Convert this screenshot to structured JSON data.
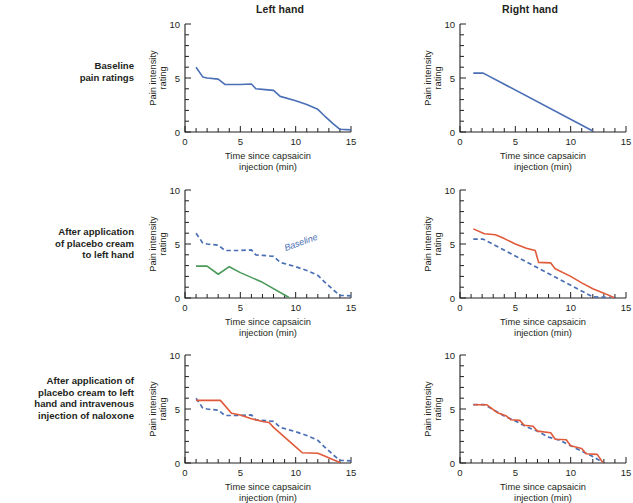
{
  "figure": {
    "columns": [
      {
        "id": "left-hand",
        "label": "Left hand"
      },
      {
        "id": "right-hand",
        "label": "Right hand"
      }
    ],
    "rows": [
      {
        "id": "baseline",
        "label": "Baseline\npain ratings"
      },
      {
        "id": "placebo",
        "label": "After application\nof placebo cream\nto left hand"
      },
      {
        "id": "naloxone",
        "label": "After application of\nplacebo cream to left\nhand and intravenous\ninjection of naloxone"
      }
    ]
  },
  "colors": {
    "baseline_blue": "#4a6fb5",
    "placebo_green": "#4a9a5a",
    "naloxone_orange": "#e05a3a",
    "axis": "#231f20"
  },
  "axes": {
    "xlabel_line1": "Time since capsaicin",
    "xlabel_line2": "injection (min)",
    "ylabel_line1": "Pain intensity",
    "ylabel_line2": "rating",
    "xlim": [
      0,
      15
    ],
    "ylim": [
      0,
      10
    ],
    "xticks_major": [
      0,
      5,
      10,
      15
    ],
    "xticks_minor_step": 1,
    "yticks_major": [
      0,
      5,
      10
    ],
    "yticks_minor_step": 1,
    "grid": false
  },
  "annotations": {
    "baseline_label": "Baseline"
  },
  "chart_data": [
    {
      "id": "r0c0",
      "type": "line",
      "title": "Left hand — Baseline pain ratings",
      "xlabel": "Time since capsaicin injection (min)",
      "ylabel": "Pain intensity rating",
      "xlim": [
        0,
        15
      ],
      "ylim": [
        0,
        10
      ],
      "series": [
        {
          "name": "Baseline (left hand)",
          "color": "#4a6fb5",
          "style": "solid",
          "points": [
            [
              1,
              6.0
            ],
            [
              1.6,
              5.1
            ],
            [
              2,
              5.0
            ],
            [
              3,
              4.9
            ],
            [
              3.6,
              4.4
            ],
            [
              5,
              4.4
            ],
            [
              6,
              4.45
            ],
            [
              6.4,
              4.0
            ],
            [
              7,
              3.95
            ],
            [
              8,
              3.85
            ],
            [
              8.6,
              3.3
            ],
            [
              10,
              2.9
            ],
            [
              11,
              2.55
            ],
            [
              12,
              2.1
            ],
            [
              12.6,
              1.5
            ],
            [
              13.4,
              0.75
            ],
            [
              14,
              0.25
            ],
            [
              15,
              0.2
            ]
          ]
        }
      ]
    },
    {
      "id": "r0c1",
      "type": "line",
      "title": "Right hand — Baseline pain ratings",
      "xlabel": "Time since capsaicin injection (min)",
      "ylabel": "Pain intensity rating",
      "xlim": [
        0,
        15
      ],
      "ylim": [
        0,
        10
      ],
      "series": [
        {
          "name": "Baseline (right hand)",
          "color": "#4a6fb5",
          "style": "solid",
          "points": [
            [
              1.2,
              5.45
            ],
            [
              2.1,
              5.45
            ],
            [
              12,
              0.1
            ]
          ]
        }
      ]
    },
    {
      "id": "r1c0",
      "type": "line",
      "title": "Left hand — After application of placebo cream to left hand",
      "xlabel": "Time since capsaicin injection (min)",
      "ylabel": "Pain intensity rating",
      "xlim": [
        0,
        15
      ],
      "ylim": [
        0,
        10
      ],
      "series": [
        {
          "name": "Baseline",
          "color": "#4a6fb5",
          "style": "dashed",
          "points": [
            [
              1,
              6.0
            ],
            [
              1.6,
              5.1
            ],
            [
              2,
              5.0
            ],
            [
              3,
              4.9
            ],
            [
              3.6,
              4.4
            ],
            [
              5,
              4.4
            ],
            [
              6,
              4.45
            ],
            [
              6.4,
              4.0
            ],
            [
              7,
              3.95
            ],
            [
              8,
              3.85
            ],
            [
              8.6,
              3.3
            ],
            [
              10,
              2.9
            ],
            [
              11,
              2.55
            ],
            [
              12,
              2.1
            ],
            [
              12.6,
              1.5
            ],
            [
              13.4,
              0.75
            ],
            [
              14,
              0.25
            ],
            [
              15,
              0.2
            ]
          ]
        },
        {
          "name": "Placebo cream",
          "color": "#4a9a5a",
          "style": "solid",
          "points": [
            [
              1,
              2.95
            ],
            [
              2,
              2.95
            ],
            [
              3,
              2.2
            ],
            [
              4,
              2.9
            ],
            [
              5,
              2.35
            ],
            [
              7,
              1.45
            ],
            [
              9.4,
              0.05
            ]
          ]
        }
      ]
    },
    {
      "id": "r1c1",
      "type": "line",
      "title": "Right hand — After application of placebo cream to left hand",
      "xlabel": "Time since capsaicin injection (min)",
      "ylabel": "Pain intensity rating",
      "xlim": [
        0,
        15
      ],
      "ylim": [
        0,
        10
      ],
      "series": [
        {
          "name": "Baseline",
          "color": "#4a6fb5",
          "style": "dashed",
          "points": [
            [
              1.2,
              5.45
            ],
            [
              2.1,
              5.45
            ],
            [
              12,
              0.1
            ],
            [
              13.6,
              0.05
            ]
          ]
        },
        {
          "name": "Placebo cream (right hand)",
          "color": "#e05a3a",
          "style": "solid",
          "points": [
            [
              1.2,
              6.4
            ],
            [
              2.2,
              5.95
            ],
            [
              3.2,
              5.85
            ],
            [
              4,
              5.5
            ],
            [
              5,
              5.0
            ],
            [
              6,
              4.6
            ],
            [
              6.8,
              4.4
            ],
            [
              7.1,
              3.3
            ],
            [
              8.2,
              3.25
            ],
            [
              8.6,
              2.7
            ],
            [
              10,
              2.0
            ],
            [
              11,
              1.4
            ],
            [
              12,
              0.85
            ],
            [
              13,
              0.45
            ],
            [
              13.9,
              0.05
            ]
          ]
        }
      ]
    },
    {
      "id": "r2c0",
      "type": "line",
      "title": "Left hand — After placebo cream to left hand and intravenous naloxone",
      "xlabel": "Time since capsaicin injection (min)",
      "ylabel": "Pain intensity rating",
      "xlim": [
        0,
        15
      ],
      "ylim": [
        0,
        10
      ],
      "series": [
        {
          "name": "Baseline",
          "color": "#4a6fb5",
          "style": "dashed",
          "points": [
            [
              1,
              6.0
            ],
            [
              1.6,
              5.1
            ],
            [
              2,
              5.0
            ],
            [
              3,
              4.9
            ],
            [
              3.6,
              4.4
            ],
            [
              5,
              4.4
            ],
            [
              6,
              4.45
            ],
            [
              6.4,
              4.0
            ],
            [
              7,
              3.95
            ],
            [
              8,
              3.85
            ],
            [
              8.6,
              3.3
            ],
            [
              10,
              2.9
            ],
            [
              11,
              2.55
            ],
            [
              12,
              2.1
            ],
            [
              12.6,
              1.5
            ],
            [
              13.4,
              0.75
            ],
            [
              14,
              0.25
            ],
            [
              15,
              0.2
            ]
          ]
        },
        {
          "name": "Placebo + naloxone",
          "color": "#e05a3a",
          "style": "solid",
          "points": [
            [
              1,
              5.8
            ],
            [
              3.2,
              5.8
            ],
            [
              4.2,
              4.6
            ],
            [
              5,
              4.45
            ],
            [
              6,
              4.1
            ],
            [
              7,
              3.85
            ],
            [
              7.6,
              3.75
            ],
            [
              8,
              3.3
            ],
            [
              9,
              2.4
            ],
            [
              10,
              1.5
            ],
            [
              10.6,
              0.95
            ],
            [
              12,
              0.9
            ],
            [
              12.4,
              0.75
            ],
            [
              13.4,
              0.3
            ],
            [
              14,
              0.05
            ]
          ]
        }
      ]
    },
    {
      "id": "r2c1",
      "type": "line",
      "title": "Right hand — After placebo cream to left hand and intravenous naloxone",
      "xlabel": "Time since capsaicin injection (min)",
      "ylabel": "Pain intensity rating",
      "xlim": [
        0,
        15
      ],
      "ylim": [
        0,
        10
      ],
      "series": [
        {
          "name": "Baseline",
          "color": "#4a6fb5",
          "style": "dashed",
          "points": [
            [
              1.2,
              5.4
            ],
            [
              2.2,
              5.4
            ],
            [
              4,
              4.35
            ],
            [
              5,
              3.9
            ],
            [
              6,
              3.35
            ],
            [
              7,
              2.95
            ],
            [
              8,
              2.4
            ],
            [
              9,
              2.1
            ],
            [
              10,
              1.6
            ],
            [
              11,
              1.1
            ],
            [
              12,
              0.6
            ],
            [
              12.9,
              0.05
            ]
          ]
        },
        {
          "name": "Placebo + naloxone (right hand)",
          "color": "#e05a3a",
          "style": "solid",
          "points": [
            [
              1.2,
              5.4
            ],
            [
              2.4,
              5.4
            ],
            [
              3.4,
              4.65
            ],
            [
              4.2,
              4.35
            ],
            [
              4.6,
              4.0
            ],
            [
              5.4,
              3.95
            ],
            [
              5.8,
              3.5
            ],
            [
              6.6,
              3.4
            ],
            [
              7,
              2.95
            ],
            [
              8.2,
              2.8
            ],
            [
              8.6,
              2.2
            ],
            [
              9.6,
              2.15
            ],
            [
              10,
              1.6
            ],
            [
              11,
              1.35
            ],
            [
              11.4,
              0.85
            ],
            [
              12.4,
              0.8
            ],
            [
              12.9,
              0.05
            ]
          ]
        }
      ]
    }
  ]
}
